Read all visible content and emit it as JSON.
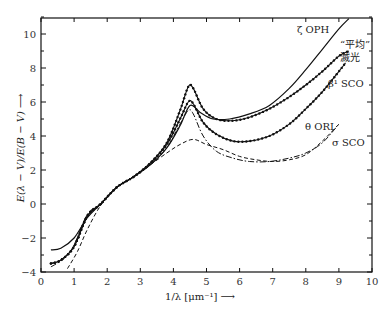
{
  "chart_data": {
    "type": "line",
    "title": "",
    "xlabel": "1/λ [μm⁻¹] ⟶",
    "ylabel": "E(λ − V)/E(B − V) ⟶",
    "xlim": [
      0,
      10
    ],
    "ylim": [
      -4,
      11
    ],
    "xticks": [
      0,
      1,
      2,
      3,
      4,
      5,
      6,
      7,
      8,
      9,
      10
    ],
    "yticks": [
      -4,
      -2,
      0,
      2,
      4,
      6,
      8,
      10
    ],
    "grid": false,
    "legend": "inline labels at curve ends",
    "series": [
      {
        "name": "ζ OPH",
        "style": "solid",
        "x": [
          0.3,
          0.6,
          1.0,
          1.4,
          1.8,
          2.3,
          2.8,
          3.3,
          3.8,
          4.2,
          4.5,
          4.8,
          5.2,
          5.7,
          6.3,
          6.9,
          7.5,
          8.0,
          8.5,
          9.0,
          9.3
        ],
        "y": [
          -2.7,
          -2.6,
          -2.0,
          -0.8,
          0.0,
          1.0,
          1.6,
          2.3,
          3.3,
          4.6,
          5.8,
          5.4,
          5.0,
          5.0,
          5.3,
          5.8,
          6.8,
          7.9,
          9.1,
          10.3,
          10.9
        ]
      },
      {
        "name": "\"平均\" 滅光",
        "style": "dotted-marker",
        "x": [
          0.3,
          0.6,
          1.0,
          1.4,
          1.8,
          2.3,
          2.8,
          3.3,
          3.8,
          4.2,
          4.45,
          4.6,
          4.9,
          5.3,
          5.8,
          6.3,
          6.9,
          7.5,
          8.0,
          8.5,
          9.0,
          9.3
        ],
        "y": [
          -3.5,
          -3.3,
          -2.5,
          -0.7,
          0.0,
          1.0,
          1.6,
          2.4,
          3.6,
          5.5,
          6.9,
          6.8,
          5.6,
          5.0,
          4.9,
          5.1,
          5.6,
          6.3,
          7.0,
          7.8,
          8.7,
          9.0
        ]
      },
      {
        "name": "β¹ SCO",
        "style": "dotted-marker",
        "x": [
          0.3,
          0.6,
          1.0,
          1.4,
          1.8,
          2.3,
          2.8,
          3.3,
          3.8,
          4.2,
          4.45,
          4.6,
          4.9,
          5.3,
          5.8,
          6.3,
          6.9,
          7.5,
          8.0,
          8.5,
          9.0,
          9.2
        ],
        "y": [
          -3.5,
          -3.3,
          -2.5,
          -0.7,
          0.0,
          1.0,
          1.6,
          2.4,
          3.5,
          5.0,
          6.0,
          5.9,
          4.8,
          4.1,
          3.7,
          3.7,
          4.0,
          4.7,
          5.6,
          6.6,
          7.8,
          8.3
        ]
      },
      {
        "name": "θ ORI",
        "style": "dot-dash",
        "x": [
          0.3,
          0.7,
          1.0,
          1.4,
          1.8,
          2.3,
          2.8,
          3.3,
          3.8,
          4.2,
          4.45,
          4.6,
          4.9,
          5.3,
          5.8,
          6.3,
          6.9,
          7.5,
          8.0,
          8.5,
          9.0
        ],
        "y": [
          -3.7,
          -3.2,
          -2.4,
          -0.6,
          0.0,
          1.0,
          1.6,
          2.3,
          3.3,
          4.7,
          5.5,
          5.3,
          4.0,
          3.1,
          2.7,
          2.5,
          2.5,
          2.7,
          3.0,
          3.6,
          4.7
        ]
      },
      {
        "name": "σ SCO",
        "style": "dashed",
        "x": [
          0.8,
          1.1,
          1.4,
          1.8,
          2.3,
          2.8,
          3.3,
          3.8,
          4.2,
          4.6,
          5.0,
          5.5,
          6.0,
          6.5,
          7.0,
          7.5,
          8.0,
          8.5,
          9.0
        ],
        "y": [
          -3.8,
          -2.8,
          -1.5,
          -0.1,
          1.0,
          1.6,
          2.3,
          3.0,
          3.5,
          3.8,
          3.5,
          3.2,
          2.8,
          2.6,
          2.5,
          2.6,
          2.9,
          3.7,
          4.7
        ]
      }
    ]
  },
  "labels": {
    "zeta_oph": "ζ OPH",
    "avg_line1": "“平均”",
    "avg_line2": "滅光",
    "beta_sco": "β¹ SCO",
    "theta_ori": "θ ORI",
    "sigma_sco": "σ SCO",
    "xlabel": "1/λ [μm⁻¹] ⟶",
    "ylabel": "E(λ − V)/E(B − V) ⟶"
  }
}
